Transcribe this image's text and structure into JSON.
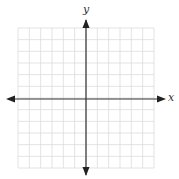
{
  "diagram": {
    "type": "cartesian-coordinate-grid",
    "x_axis_label": "x",
    "y_axis_label": "y",
    "grid": {
      "columns": 12,
      "rows": 12,
      "squares_left_of_y_axis": 6,
      "squares_right_of_y_axis": 6,
      "squares_above_x_axis": 6,
      "squares_below_x_axis": 6,
      "tick_labels": "none"
    },
    "colors": {
      "grid_line": "#dcdcdc",
      "axis_line": "#333333",
      "background": "#ffffff"
    },
    "axes_have_arrows_both_ends": true
  }
}
